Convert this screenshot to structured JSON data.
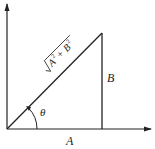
{
  "diagram": {
    "type": "right-triangle-vector",
    "labels": {
      "hypotenuse": "√(A² + B²)",
      "hyp_A": "A",
      "hyp_B": "B",
      "exp": "2",
      "vertical_side": "B",
      "horizontal_side": "A",
      "angle": "θ"
    },
    "colors": {
      "line": "#222222",
      "background": "#ffffff"
    }
  }
}
